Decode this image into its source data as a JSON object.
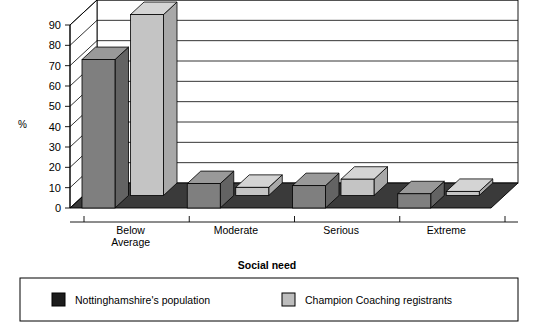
{
  "chart_data": {
    "type": "bar",
    "title": "",
    "subtitle": "",
    "xlabel": "Social need",
    "ylabel": "%",
    "categories": [
      "Below Average",
      "Moderate",
      "Serious",
      "Extreme"
    ],
    "category_lines": [
      [
        "Below",
        "Average"
      ],
      [
        "Moderate"
      ],
      [
        "Serious"
      ],
      [
        "Extreme"
      ]
    ],
    "series": [
      {
        "name": "Nottinghamshire's population",
        "color": "#1c1c1c",
        "bar_color": "#7f7f7f",
        "values": [
          73,
          12,
          11,
          7
        ]
      },
      {
        "name": "Champion Coaching registrants",
        "color": "#bdbdbd",
        "bar_color": "#c4c4c4",
        "values": [
          89,
          4,
          8,
          2
        ]
      }
    ],
    "ylim": [
      0,
      90
    ],
    "yticks": [
      0,
      10,
      20,
      30,
      40,
      50,
      60,
      70,
      80,
      90
    ],
    "ytick_labels": [
      "0",
      "10",
      "20",
      "30",
      "40",
      "50",
      "60",
      "70",
      "80",
      "90"
    ],
    "grid": true,
    "grid_axis": "y",
    "legend_position": "bottom",
    "three_d": true
  },
  "axes": {
    "y_title": "%",
    "x_title": "Social need"
  },
  "legend": {
    "entries": [
      {
        "label": "Nottinghamshire's population",
        "swatch": "#1c1c1c"
      },
      {
        "label": "Champion Coaching registrants",
        "swatch": "#bdbdbd"
      }
    ]
  },
  "palette": {
    "series1_front": "#7f7f7f",
    "series1_top": "#999999",
    "series1_side": "#636363",
    "series2_front": "#c4c4c4",
    "series2_top": "#d4d4d4",
    "series2_side": "#a8a8a8",
    "floor": "#3a3a3a",
    "floor_front": "#2b2b2b",
    "wall": "#ffffff",
    "outline": "#000000"
  }
}
